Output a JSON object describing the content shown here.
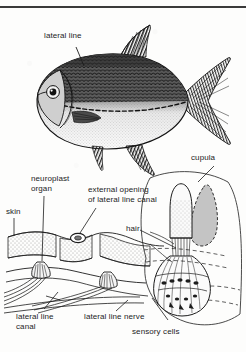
{
  "figure": {
    "background_color": "#fdfdfc",
    "ink_color": "#1c1c1c",
    "rule_color": "#3a3a3a",
    "cupula_shadow_color": "#b9b9b9"
  },
  "panels": {
    "top": {
      "name": "fish-whole-body-illustration",
      "subject": "fish showing lateral line"
    },
    "bottom": {
      "name": "lateral-line-canal-cross-section",
      "subject": "cutaway of skin, canal and neuromast organs"
    },
    "inset": {
      "name": "neuromast-magnified-inset",
      "subject": "cupula with hair bundle and sensory cells"
    }
  },
  "labels": {
    "lateral_line": "lateral line",
    "cupula": "cupula",
    "neuroplast_organ": "neuroplast\norgan",
    "neuroplast_organ_line1": "neuroplast",
    "neuroplast_organ_line2": "organ",
    "external_opening_line1": "external opening",
    "external_opening_line2": "of lateral line canal",
    "skin": "skin",
    "hair": "hair",
    "lateral_line_canal_line1": "lateral line",
    "lateral_line_canal_line2": "canal",
    "lateral_line_nerve": "lateral line nerve",
    "sensory_cells": "sensory cells"
  }
}
